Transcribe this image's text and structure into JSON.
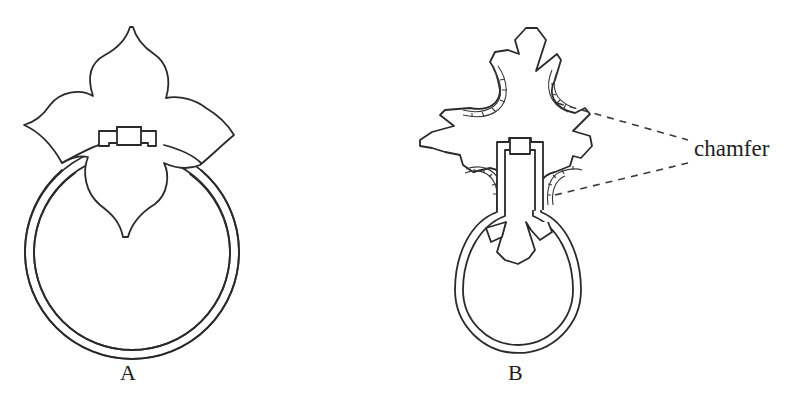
{
  "figure": {
    "labels": {
      "a": "A",
      "b": "B",
      "chamfer": "chamfer"
    },
    "figures": [
      {
        "id": "A",
        "description": "Quatrefoil backplate with round ring handle and bail"
      },
      {
        "id": "B",
        "description": "Cross-shaped backplate with chamfered edges, bulbous ring handle"
      }
    ],
    "annotation": {
      "text": "chamfer",
      "pointer_style": "dashed",
      "pointer_count": 2
    },
    "colors": {
      "ink": "#2a2a2a",
      "background": "#ffffff"
    }
  }
}
